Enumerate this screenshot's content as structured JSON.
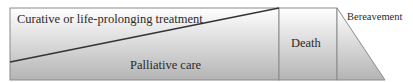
{
  "diagram": {
    "type": "care-continuum",
    "labels": {
      "curative": "Curative or life-prolonging treatment",
      "palliative": "Palliative care",
      "death": "Death",
      "bereavement": "Bereavement"
    },
    "colors": {
      "gradient_top": "#ffffff",
      "gradient_bottom": "#b4b4b4",
      "stroke": "#7a7a7a",
      "diagonal": "#333333",
      "text": "#2a2a2a"
    }
  }
}
